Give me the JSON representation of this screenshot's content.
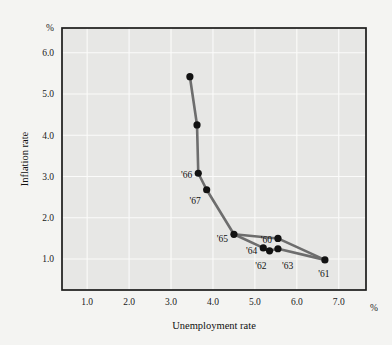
{
  "chart_data": {
    "type": "line",
    "title": "",
    "xlabel": "Unemployment rate",
    "ylabel": "Inflation rate",
    "x_unit": "%",
    "y_unit": "%",
    "xlim": [
      0.4,
      7.65
    ],
    "ylim": [
      0.25,
      6.6
    ],
    "xticks": [
      "1.0",
      "2.0",
      "3.0",
      "4.0",
      "5.0",
      "6.0",
      "7.0"
    ],
    "xtick_values": [
      1.0,
      2.0,
      3.0,
      4.0,
      5.0,
      6.0,
      7.0
    ],
    "yticks": [
      "1.0",
      "2.0",
      "3.0",
      "4.0",
      "5.0",
      "6.0"
    ],
    "ytick_values": [
      1.0,
      2.0,
      3.0,
      4.0,
      5.0,
      6.0
    ],
    "grid": true,
    "legend": "none",
    "marker": "filled-circle",
    "line_color": "#6d6d6d",
    "marker_color": "#121212",
    "plot_bg_color": "#e7e7e5",
    "grid_color": "#fbfbfa",
    "page_bg_color": "#f4f4f2",
    "points": [
      {
        "label": "",
        "x": 3.45,
        "y": 5.42,
        "label_dx": 0,
        "label_dy": 0,
        "label_anchor": "end"
      },
      {
        "label": "",
        "x": 3.62,
        "y": 4.25,
        "label_dx": 0,
        "label_dy": 0,
        "label_anchor": "end"
      },
      {
        "label": "'66",
        "x": 3.65,
        "y": 3.08,
        "label_dx": -6,
        "label_dy": 2,
        "label_anchor": "end"
      },
      {
        "label": "'67",
        "x": 3.85,
        "y": 2.68,
        "label_dx": -6,
        "label_dy": 11,
        "label_anchor": "end"
      },
      {
        "label": "'65",
        "x": 4.5,
        "y": 1.6,
        "label_dx": -6,
        "label_dy": 5,
        "label_anchor": "end"
      },
      {
        "label": "'64",
        "x": 5.2,
        "y": 1.27,
        "label_dx": -6,
        "label_dy": 3,
        "label_anchor": "end"
      },
      {
        "label": "'62",
        "x": 5.35,
        "y": 1.2,
        "label_dx": -3,
        "label_dy": 15,
        "label_anchor": "end"
      },
      {
        "label": "'63",
        "x": 5.55,
        "y": 1.25,
        "label_dx": 4,
        "label_dy": 17,
        "label_anchor": "start"
      },
      {
        "label": "'60",
        "x": 5.55,
        "y": 1.5,
        "label_dx": -6,
        "label_dy": 1,
        "label_anchor": "end"
      },
      {
        "label": "'61",
        "x": 6.67,
        "y": 0.98,
        "label_dx": -1,
        "label_dy": 14,
        "label_anchor": "middle"
      }
    ],
    "path_main": [
      {
        "x": 3.45,
        "y": 5.42
      },
      {
        "x": 3.62,
        "y": 4.25
      },
      {
        "x": 3.65,
        "y": 3.08
      },
      {
        "x": 3.85,
        "y": 2.68
      },
      {
        "x": 4.5,
        "y": 1.6
      },
      {
        "x": 5.2,
        "y": 1.27
      },
      {
        "x": 5.35,
        "y": 1.2
      },
      {
        "x": 5.55,
        "y": 1.25
      },
      {
        "x": 6.67,
        "y": 0.98
      }
    ],
    "path_branch": [
      {
        "x": 4.5,
        "y": 1.6
      },
      {
        "x": 5.55,
        "y": 1.5
      },
      {
        "x": 6.67,
        "y": 0.98
      }
    ],
    "series_name": "Phillips curve"
  }
}
